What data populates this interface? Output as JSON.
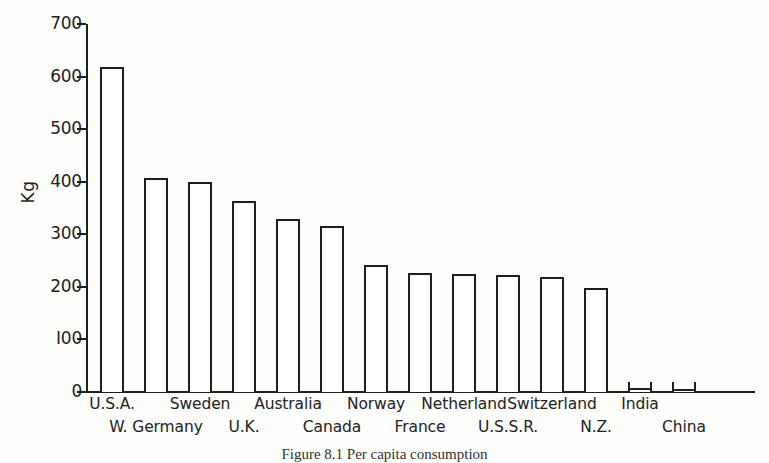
{
  "chart_data": {
    "type": "bar",
    "title": "",
    "xlabel": "",
    "ylabel": "Kg",
    "ylim": [
      0,
      700
    ],
    "yticks": [
      0,
      100,
      200,
      300,
      400,
      500,
      600,
      700
    ],
    "ytick_labels": [
      "0",
      "I00",
      "200",
      "300",
      "400",
      "500",
      "600",
      "700"
    ],
    "grid": false,
    "legend": "none",
    "categories": [
      "U.S.A.",
      "W. Germany",
      "Sweden",
      "U.K.",
      "Australia",
      "Canada",
      "Norway",
      "France",
      "Netherland",
      "U.S.S.R.",
      "Switzerland",
      "N.Z.",
      "India",
      "China"
    ],
    "values": [
      618,
      408,
      400,
      364,
      329,
      315,
      241,
      226,
      225,
      222,
      218,
      197,
      8,
      6
    ],
    "bar_style": {
      "fill": "#ffffff",
      "edge": "#1e1e1e",
      "edge_width": 2
    }
  },
  "axis": {
    "y_label": "Kg",
    "y_tick_labels": [
      "700",
      "600",
      "500",
      "400",
      "300",
      "200",
      "I00",
      "0"
    ]
  },
  "xaxis_label_rows": {
    "upper": [
      "U.S.A.",
      "Sweden",
      "Australia",
      "Norway",
      "Netherland",
      "Switzerland",
      "India"
    ],
    "lower": [
      "W. Germany",
      "U.K.",
      "Canada",
      "France",
      "U.S.S.R.",
      "N.Z.",
      "China"
    ]
  },
  "caption": {
    "figure_number": "Figure 8.1",
    "text": "Figure 8.1   Per capita consumption"
  },
  "colors": {
    "ink": "#1e1e1e",
    "paper": "#fdfdfb",
    "bar_fill": "#ffffff"
  }
}
